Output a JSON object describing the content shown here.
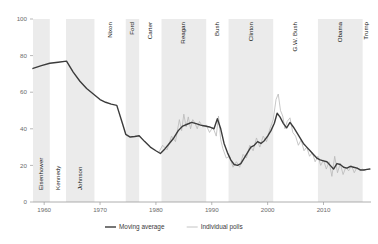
{
  "chart_data": {
    "type": "line",
    "title": "",
    "subtitle": "",
    "xlabel": "",
    "ylabel": "",
    "xlim": [
      1958,
      2018.5
    ],
    "ylim": [
      0,
      100
    ],
    "yticks": [
      0,
      20,
      40,
      60,
      80,
      100
    ],
    "ytick_labels": [
      "0",
      "20",
      "40",
      "60",
      "80",
      "100"
    ],
    "xticks": [
      1960,
      1970,
      1980,
      1990,
      2000,
      2010
    ],
    "xtick_labels": [
      "1960",
      "1970",
      "1980",
      "1990",
      "2000",
      "2010"
    ],
    "grid": false,
    "legend_position": "bottom",
    "legend": [
      {
        "name": "Moving average",
        "color": "#3b3b3b",
        "width": 1.4
      },
      {
        "name": "Individual polls",
        "color": "#b5b5b5",
        "width": 0.8
      }
    ],
    "shaded_bands": [
      {
        "label": "Eisenhower",
        "start": 1958.0,
        "end": 1961.0,
        "shaded": true
      },
      {
        "label": "Kennedy",
        "start": 1961.0,
        "end": 1963.9,
        "shaded": false
      },
      {
        "label": "Johnson",
        "start": 1963.9,
        "end": 1969.0,
        "shaded": true
      },
      {
        "label": "Nixon",
        "start": 1969.0,
        "end": 1974.6,
        "shaded": false
      },
      {
        "label": "Ford",
        "start": 1974.6,
        "end": 1977.0,
        "shaded": true
      },
      {
        "label": "Carter",
        "start": 1977.0,
        "end": 1981.0,
        "shaded": false
      },
      {
        "label": "Reagan",
        "start": 1981.0,
        "end": 1989.0,
        "shaded": true
      },
      {
        "label": "Bush",
        "start": 1989.0,
        "end": 1993.0,
        "shaded": false
      },
      {
        "label": "Clinton",
        "start": 1993.0,
        "end": 2001.0,
        "shaded": true
      },
      {
        "label": "G.W. Bush",
        "start": 2001.0,
        "end": 2009.0,
        "shaded": false
      },
      {
        "label": "Obama",
        "start": 2009.0,
        "end": 2017.0,
        "shaded": true
      },
      {
        "label": "Trump",
        "start": 2017.0,
        "end": 2018.5,
        "shaded": false
      }
    ],
    "band_color": "#ebebeb",
    "series": [
      {
        "name": "Moving average",
        "color": "#3b3b3b",
        "x": [
          1958.0,
          1959.5,
          1961.0,
          1962.5,
          1964.0,
          1965.2,
          1966.4,
          1967.6,
          1968.8,
          1970.0,
          1971.0,
          1972.0,
          1973.0,
          1974.0,
          1974.6,
          1975.4,
          1976.2,
          1977.0,
          1978.0,
          1979.0,
          1980.0,
          1980.8,
          1981.6,
          1982.4,
          1983.2,
          1984.0,
          1984.8,
          1985.6,
          1986.4,
          1987.2,
          1988.0,
          1988.8,
          1989.6,
          1990.4,
          1991.0,
          1991.6,
          1992.2,
          1992.8,
          1993.4,
          1994.0,
          1994.6,
          1995.2,
          1995.8,
          1996.4,
          1997.0,
          1997.6,
          1998.2,
          1998.8,
          1999.4,
          2000.0,
          2000.6,
          2001.2,
          2001.7,
          2002.2,
          2002.8,
          2003.4,
          2004.0,
          2004.6,
          2005.2,
          2005.8,
          2006.4,
          2007.0,
          2007.6,
          2008.2,
          2008.8,
          2009.4,
          2010.0,
          2010.6,
          2011.2,
          2011.8,
          2012.4,
          2013.0,
          2013.6,
          2014.2,
          2014.8,
          2015.4,
          2016.0,
          2016.6,
          2017.2,
          2017.8,
          2018.3
        ],
        "y": [
          73.0,
          74.5,
          75.8,
          76.4,
          77.0,
          71.0,
          66.0,
          62.0,
          59.0,
          56.0,
          54.5,
          53.5,
          52.8,
          43.0,
          37.0,
          35.5,
          35.8,
          36.2,
          33.0,
          30.0,
          28.0,
          26.5,
          29.0,
          32.0,
          35.0,
          39.0,
          41.5,
          42.5,
          43.5,
          42.8,
          42.0,
          41.5,
          41.0,
          40.0,
          45.5,
          40.0,
          32.0,
          27.0,
          23.0,
          20.5,
          20.0,
          21.0,
          24.0,
          27.0,
          30.0,
          31.0,
          33.0,
          32.0,
          33.5,
          36.0,
          39.0,
          43.0,
          48.5,
          46.5,
          43.0,
          40.5,
          43.5,
          41.0,
          38.0,
          35.0,
          32.0,
          30.0,
          28.0,
          26.0,
          24.0,
          23.0,
          22.5,
          22.0,
          20.0,
          18.0,
          21.0,
          20.5,
          19.0,
          18.5,
          19.5,
          19.0,
          18.5,
          17.5,
          17.5,
          17.8,
          18.0
        ]
      },
      {
        "name": "Individual polls",
        "color": "#b9b9b9",
        "x": [
          1980.5,
          1981.2,
          1982.0,
          1982.8,
          1983.5,
          1984.2,
          1984.6,
          1985.0,
          1985.4,
          1985.8,
          1986.2,
          1986.6,
          1987.0,
          1987.4,
          1987.8,
          1988.4,
          1989.0,
          1989.6,
          1990.2,
          1990.8,
          1991.2,
          1991.6,
          1992.0,
          1992.6,
          1993.2,
          1993.8,
          1994.4,
          1995.0,
          1995.6,
          1996.2,
          1996.8,
          1997.4,
          1998.0,
          1998.6,
          1999.2,
          1999.8,
          2000.4,
          2001.0,
          2001.5,
          2001.9,
          2002.3,
          2002.7,
          2003.1,
          2003.5,
          2004.0,
          2004.5,
          2005.0,
          2005.5,
          2006.0,
          2006.5,
          2007.0,
          2007.5,
          2008.0,
          2008.5,
          2009.0,
          2009.5,
          2010.0,
          2010.5,
          2011.0,
          2011.5,
          2012.0,
          2012.5,
          2013.0,
          2013.5,
          2014.0,
          2014.5,
          2015.0,
          2015.5,
          2016.0,
          2016.5,
          2017.0,
          2017.5
        ],
        "y": [
          27.0,
          31.0,
          28.5,
          36.0,
          33.0,
          45.0,
          39.0,
          48.0,
          41.0,
          46.5,
          40.0,
          45.0,
          43.0,
          40.0,
          44.0,
          41.0,
          42.0,
          38.0,
          41.0,
          36.0,
          47.0,
          34.0,
          29.0,
          24.0,
          25.0,
          19.0,
          22.0,
          19.0,
          26.0,
          24.0,
          31.0,
          28.0,
          35.0,
          30.0,
          36.0,
          33.0,
          40.0,
          45.0,
          56.0,
          59.0,
          50.0,
          47.0,
          40.0,
          44.0,
          46.0,
          38.0,
          36.0,
          31.0,
          34.0,
          28.0,
          30.0,
          25.0,
          27.0,
          22.0,
          25.0,
          20.0,
          23.0,
          18.0,
          22.0,
          14.0,
          25.0,
          16.0,
          21.0,
          15.0,
          19.0,
          17.0,
          20.0,
          16.0,
          19.0,
          17.0,
          18.0,
          17.0
        ]
      }
    ]
  },
  "axis": {
    "axis_color": "#9a9a9a",
    "tick_color": "#9a9a9a"
  }
}
